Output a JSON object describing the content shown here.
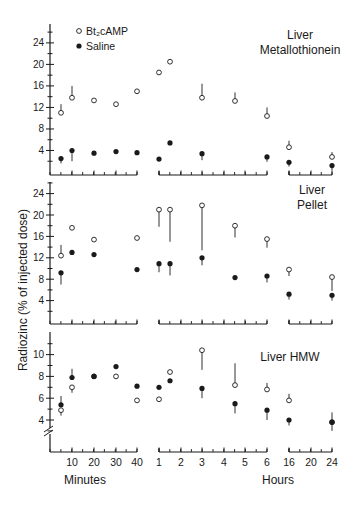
{
  "figure": {
    "ylabel": "Radiozinc (% of injected dose)",
    "xlabel_minutes": "Minutes",
    "xlabel_hours": "Hours",
    "legend": [
      {
        "label": "Bt₂cAMP",
        "marker": "open-circle"
      },
      {
        "label": "Saline",
        "marker": "filled-circle"
      }
    ],
    "x_segments": {
      "minutes": {
        "ticks": [
          10,
          20,
          30,
          40
        ],
        "tick_labels": [
          "10",
          "20",
          "30",
          "40"
        ]
      },
      "hours": {
        "ticks": [
          1,
          2,
          3,
          4,
          5,
          6
        ],
        "tick_labels": [
          "1",
          "2",
          "3",
          "4",
          "5",
          "6"
        ]
      },
      "late_hours": {
        "ticks": [
          16,
          20,
          24
        ],
        "tick_labels": [
          "16",
          "20",
          "24"
        ]
      }
    },
    "colors": {
      "ink": "#1a1a1a",
      "background": "#ffffff"
    }
  },
  "chart_data": [
    {
      "type": "scatter",
      "title": "Liver Metallothionein",
      "title_lines": [
        "Liver",
        "Metallothionein"
      ],
      "xlabel": "Time (Minutes | Hours)",
      "ylabel": "Radiozinc (% of injected dose)",
      "ylim": [
        0,
        28
      ],
      "yticks": [
        4,
        8,
        12,
        16,
        20,
        24
      ],
      "x": [
        "5 min",
        "10 min",
        "20 min",
        "30 min",
        "40 min",
        "1 h",
        "1.5 h",
        "3 h",
        "4.5 h",
        "6 h",
        "16 h",
        "24 h"
      ],
      "series": [
        {
          "name": "Bt2cAMP",
          "marker": "open",
          "values": [
            11.0,
            13.8,
            13.3,
            12.6,
            15.0,
            18.5,
            20.5,
            13.8,
            13.2,
            10.4,
            4.6,
            2.8
          ],
          "error_up": [
            1.6,
            2.2,
            0,
            0,
            0,
            0,
            0,
            2.6,
            1.6,
            1.6,
            1.2,
            0.9
          ]
        },
        {
          "name": "Saline",
          "marker": "filled",
          "values": [
            2.5,
            4.0,
            3.5,
            3.8,
            3.6,
            2.4,
            5.4,
            3.4,
            null,
            2.8,
            1.8,
            1.2
          ],
          "error_down": [
            0.9,
            2.0,
            0,
            0,
            0,
            0,
            0,
            1.2,
            0,
            0.9,
            0.8,
            0.9
          ]
        }
      ]
    },
    {
      "type": "scatter",
      "title": "Liver Pellet",
      "title_lines": [
        "Liver",
        "Pellet"
      ],
      "ylim": [
        0,
        26
      ],
      "yticks": [
        4,
        8,
        12,
        16,
        20,
        24
      ],
      "x": [
        "5 min",
        "10 min",
        "20 min",
        "30 min",
        "40 min",
        "1 h",
        "1.5 h",
        "3 h",
        "4.5 h",
        "6 h",
        "16 h",
        "24 h"
      ],
      "series": [
        {
          "name": "Bt2cAMP",
          "marker": "open",
          "values": [
            12.4,
            17.6,
            15.4,
            null,
            15.7,
            21.0,
            21.0,
            21.8,
            18.0,
            15.5,
            9.8,
            8.4
          ],
          "error_up": [
            2.0,
            0,
            0,
            0,
            0,
            0,
            0,
            0,
            0,
            0,
            0,
            0
          ],
          "error_down": [
            0,
            0,
            0,
            0,
            0,
            3.2,
            6.0,
            8.4,
            2.2,
            1.6,
            1.2,
            2.6
          ]
        },
        {
          "name": "Saline",
          "marker": "filled",
          "values": [
            9.2,
            13.0,
            12.6,
            null,
            9.8,
            10.9,
            10.9,
            12.0,
            8.3,
            8.6,
            5.2,
            5.0
          ],
          "error_down": [
            2.2,
            0,
            0,
            0,
            0,
            1.6,
            2.2,
            1.4,
            0,
            1.2,
            1.0,
            1.0
          ]
        }
      ]
    },
    {
      "type": "scatter",
      "title": "Liver HMW",
      "title_lines": [
        "Liver  HMW"
      ],
      "ylim": [
        2,
        11.5
      ],
      "yticks": [
        4,
        6,
        8,
        10
      ],
      "axis_break": true,
      "x": [
        "5 min",
        "10 min",
        "20 min",
        "30 min",
        "40 min",
        "1 h",
        "1.5 h",
        "3 h",
        "4.5 h",
        "6 h",
        "16 h",
        "24 h"
      ],
      "series": [
        {
          "name": "Bt2cAMP",
          "marker": "open",
          "values": [
            4.9,
            7.0,
            8.0,
            8.0,
            5.8,
            5.9,
            8.4,
            10.4,
            7.2,
            6.8,
            5.8,
            3.8
          ],
          "error_up": [
            0,
            0,
            0,
            0,
            0,
            0,
            0,
            0,
            2.0,
            0.6,
            0.6,
            0.9
          ],
          "error_down": [
            0.5,
            0.5,
            0,
            0,
            0,
            0,
            0,
            1.8,
            0,
            0,
            0,
            0
          ]
        },
        {
          "name": "Saline",
          "marker": "filled",
          "values": [
            5.4,
            7.9,
            8.0,
            8.9,
            7.1,
            7.0,
            7.6,
            6.9,
            5.5,
            4.9,
            4.0,
            3.8
          ],
          "error_up": [
            0.8,
            0.8,
            0,
            0,
            0,
            0,
            0,
            0,
            0,
            0,
            0,
            0
          ],
          "error_down": [
            0,
            0,
            0,
            0,
            0,
            0,
            0,
            0.9,
            0.9,
            0.9,
            0.5,
            0.8
          ]
        }
      ]
    }
  ]
}
